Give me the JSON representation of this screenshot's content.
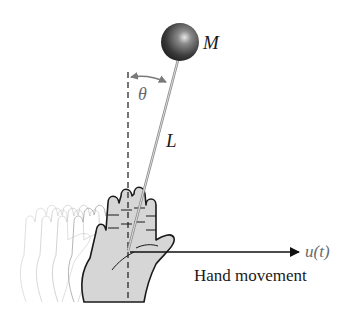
{
  "diagram": {
    "labels": {
      "mass": "M",
      "angle": "θ",
      "length": "L",
      "input": "u(t)",
      "caption": "Hand movement"
    },
    "colors": {
      "ball": "#3a3a3a",
      "rod": "#9a9a9a",
      "hand_fill": "#d6d6d6",
      "hand_outline": "#1a1a1a",
      "ghost_outline": "#bdbdbd",
      "angle_arrow": "#7a7a7a",
      "text": "#1a1a1a",
      "input_text": "#6a6a6a"
    }
  }
}
